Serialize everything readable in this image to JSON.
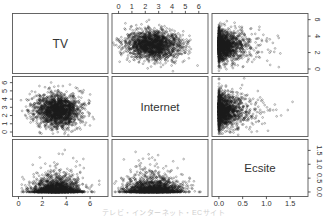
{
  "figure": {
    "type": "scatterplot-matrix",
    "variables": [
      "TV",
      "Internet",
      "Ecsite"
    ],
    "panel_labels": {
      "diagonal_1": "TV",
      "diagonal_2": "Internet",
      "diagonal_3": "Ecsite"
    },
    "caption": "テレビ・インターネット・ECサイト"
  },
  "axes": {
    "top_internet": {
      "position": "top",
      "ticks": [
        "0",
        "1",
        "2",
        "3",
        "4",
        "5",
        "6"
      ],
      "values": [
        0,
        1,
        2,
        3,
        4,
        5,
        6
      ],
      "range": [
        -0.4,
        6.6
      ]
    },
    "right_internet": {
      "position": "right",
      "ticks": [
        "0",
        "2",
        "4",
        "6"
      ],
      "values": [
        0,
        2,
        4,
        6
      ],
      "range": [
        -0.4,
        6.6
      ]
    },
    "left_internet": {
      "position": "left",
      "ticks": [
        "0",
        "1",
        "2",
        "3",
        "4",
        "5",
        "6"
      ],
      "values": [
        0,
        1,
        2,
        3,
        4,
        5,
        6
      ],
      "range": [
        -0.4,
        6.6
      ]
    },
    "right_ecsite": {
      "position": "right",
      "ticks": [
        "0.0",
        "0.5",
        "1.0",
        "1.5"
      ],
      "values": [
        0.0,
        0.5,
        1.0,
        1.5
      ],
      "range": [
        -0.12,
        1.85
      ]
    },
    "bottom_tv": {
      "position": "bottom",
      "ticks": [
        "0",
        "2",
        "4",
        "6"
      ],
      "values": [
        0,
        2,
        4,
        6
      ],
      "range": [
        -0.4,
        7.4
      ]
    },
    "bottom_ecsite": {
      "position": "bottom",
      "ticks": [
        "0.0",
        "0.5",
        "1.0",
        "1.5"
      ],
      "values": [
        0.0,
        0.5,
        1.0,
        1.5
      ],
      "range": [
        -0.12,
        1.85
      ]
    }
  },
  "chart_data": {
    "type": "scatter",
    "title": "",
    "subtitle": "",
    "xlabel": "",
    "ylabel": "",
    "matrix": {
      "rows": [
        "TV",
        "Internet",
        "Ecsite"
      ],
      "cols": [
        "TV",
        "Internet",
        "Ecsite"
      ],
      "n_points": 1800
    },
    "panels": [
      {
        "row": 0,
        "col": 0,
        "kind": "diagonal",
        "label": "TV"
      },
      {
        "row": 0,
        "col": 1,
        "kind": "scatter",
        "x": "Internet",
        "y": "TV",
        "xlim": [
          -0.4,
          6.6
        ],
        "ylim": [
          -0.4,
          7.4
        ],
        "cloud": "dense-ellipse",
        "x_center": 2.6,
        "y_center": 3.3,
        "x_spread": 1.05,
        "y_spread": 1.0,
        "correlation": -0.05,
        "description": "Broad elliptical cloud centered near (2.6, 3.3); slightly wider horizontally than vertically."
      },
      {
        "row": 0,
        "col": 2,
        "kind": "scatter",
        "x": "Ecsite",
        "y": "TV",
        "xlim": [
          -0.12,
          1.85
        ],
        "ylim": [
          -0.4,
          7.4
        ],
        "cloud": "zero-spike-fan",
        "zero_mass_fraction": 0.3,
        "x_center": 0.3,
        "y_center": 3.2,
        "x_spread": 0.33,
        "y_spread": 1.05,
        "correlation": -0.05,
        "description": "Dense vertical bar of points at Ecsite = 0 spanning the TV range, with a right-fanning sparse tail."
      },
      {
        "row": 1,
        "col": 0,
        "kind": "scatter",
        "x": "TV",
        "y": "Internet",
        "xlim": [
          -0.4,
          7.4
        ],
        "ylim": [
          -0.4,
          6.6
        ],
        "cloud": "dense-ellipse",
        "x_center": 3.3,
        "y_center": 2.6,
        "x_spread": 1.0,
        "y_spread": 1.05,
        "correlation": -0.05,
        "description": "Mirror of the TV vs Internet panel; dense round cloud centered near (3.3, 2.6)."
      },
      {
        "row": 1,
        "col": 1,
        "kind": "diagonal",
        "label": "Internet"
      },
      {
        "row": 1,
        "col": 2,
        "kind": "scatter",
        "x": "Ecsite",
        "y": "Internet",
        "xlim": [
          -0.12,
          1.85
        ],
        "ylim": [
          -0.4,
          6.6
        ],
        "cloud": "zero-spike-fan",
        "zero_mass_fraction": 0.3,
        "x_center": 0.32,
        "y_center": 2.6,
        "x_spread": 0.35,
        "y_spread": 1.05,
        "correlation": 0.08,
        "description": "Dense vertical spike at Ecsite = 0, sparse points fanning right and slightly downward."
      },
      {
        "row": 2,
        "col": 0,
        "kind": "scatter",
        "x": "TV",
        "y": "Ecsite",
        "xlim": [
          -0.4,
          7.4
        ],
        "ylim": [
          -0.12,
          1.85
        ],
        "cloud": "baseline-spike-fan",
        "zero_mass_fraction": 0.3,
        "x_center": 3.2,
        "y_center": 0.3,
        "x_spread": 1.05,
        "y_spread": 0.33,
        "correlation": -0.05,
        "description": "Dense horizontal baseline at Ecsite = 0 across the TV range, with an upward plume centered near TV = 3."
      },
      {
        "row": 2,
        "col": 1,
        "kind": "scatter",
        "x": "Internet",
        "y": "Ecsite",
        "xlim": [
          -0.4,
          6.6
        ],
        "ylim": [
          -0.12,
          1.85
        ],
        "cloud": "baseline-spike-fan",
        "zero_mass_fraction": 0.3,
        "x_center": 2.6,
        "y_center": 0.32,
        "x_spread": 1.05,
        "y_spread": 0.35,
        "correlation": 0.08,
        "description": "Dense horizontal baseline at Ecsite = 0, with a left-skewed upward plume centered near Internet = 2.3."
      },
      {
        "row": 2,
        "col": 2,
        "kind": "diagonal",
        "label": "Ecsite"
      }
    ],
    "grid": false,
    "legend": "none",
    "point_style": {
      "marker": "circle-open",
      "color": "#1a1a1a",
      "radius": 0.9,
      "opacity": 0.55
    }
  },
  "style": {
    "panel_border": "#555555",
    "point_color": "#1a1a1a",
    "tick_color": "#333333",
    "label_color": "#333333",
    "background": "#ffffff"
  }
}
